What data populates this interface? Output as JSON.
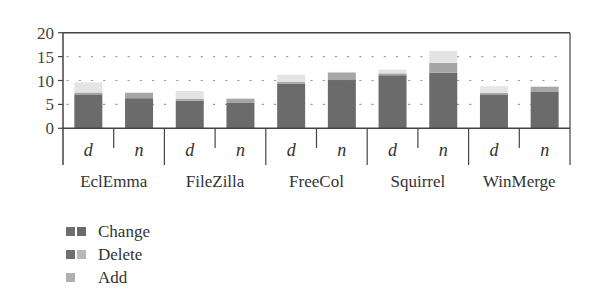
{
  "chart_data": {
    "type": "bar",
    "stacked": true,
    "title": "",
    "xlabel": "",
    "ylabel": "",
    "ylim": [
      0,
      20
    ],
    "yticks": [
      0,
      5,
      10,
      15,
      20
    ],
    "grid": "dotted horizontal at 5, 10, 15",
    "groups": [
      "EclEmma",
      "FileZilla",
      "FreeCol",
      "Squirrel",
      "WinMerge"
    ],
    "subcategories": [
      "d",
      "n"
    ],
    "categories": [
      "EclEmma d",
      "EclEmma n",
      "FileZilla d",
      "FileZilla n",
      "FreeCol d",
      "FreeCol n",
      "Squirrel d",
      "Squirrel n",
      "WinMerge d",
      "WinMerge n"
    ],
    "series": [
      {
        "name": "Change",
        "color": "#6b6b6b",
        "values": [
          7.1,
          6.3,
          5.8,
          5.3,
          9.3,
          10.1,
          11.1,
          11.6,
          7.1,
          7.6
        ]
      },
      {
        "name": "Delete",
        "color": "#a8a8a8",
        "values": [
          0.4,
          1.1,
          0.4,
          0.9,
          0.4,
          1.6,
          0.4,
          2.1,
          0.3,
          1.1
        ]
      },
      {
        "name": "Add",
        "color": "#e2e2e2",
        "values": [
          2.1,
          0.2,
          1.6,
          0.1,
          1.5,
          0.1,
          0.8,
          2.5,
          1.4,
          0.1
        ]
      }
    ],
    "legend_position": "below-left"
  },
  "legend": {
    "items": [
      {
        "label": "Change"
      },
      {
        "label": "Delete"
      },
      {
        "label": "Add"
      }
    ]
  }
}
